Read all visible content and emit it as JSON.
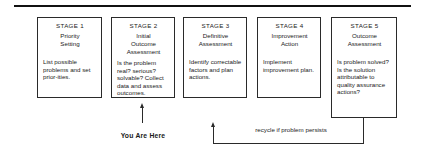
{
  "diagram": {
    "type": "process-flow",
    "stages": [
      {
        "label": "STAGE 1",
        "title_lines": [
          "Priority",
          "Setting"
        ],
        "description": "List possible problems and set prior-ities."
      },
      {
        "label": "STAGE 2",
        "title_lines": [
          "Initial",
          "Outcome",
          "Assessment"
        ],
        "description": "Is the problem real? serious? solvable? Collect data and assess outcomes."
      },
      {
        "label": "STAGE 3",
        "title_lines": [
          "Definitive",
          "Assessment"
        ],
        "description": "Identify correctable factors and plan actions."
      },
      {
        "label": "STAGE 4",
        "title_lines": [
          "Improvement",
          "Action"
        ],
        "description": "Implement improvement plan."
      },
      {
        "label": "STAGE 5",
        "title_lines": [
          "Outcome",
          "Assessment"
        ],
        "description": "Is problem solved? Is the solution attributable to quality assurance actions?"
      }
    ],
    "current_marker": {
      "label": "You Are Here",
      "points_to_stage": "STAGE 2"
    },
    "feedback_loop": {
      "label": "recycle if problem persists",
      "from_stage": "STAGE 5",
      "to_stage": "STAGE 3"
    },
    "colors": {
      "line": "#2a2a2a",
      "text": "#1a1a1a",
      "background": "#ffffff"
    }
  }
}
